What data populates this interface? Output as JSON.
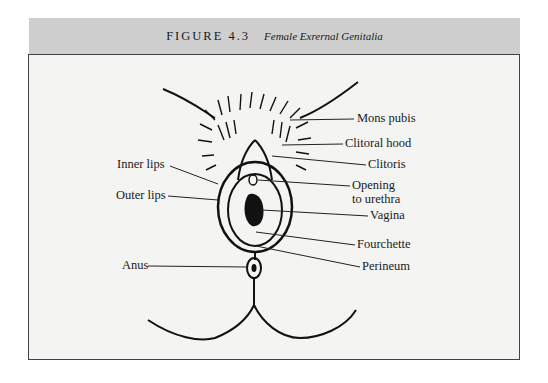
{
  "figure": {
    "number": "FIGURE 4.3",
    "title": "Female Exrernal Genitalia"
  },
  "labels": {
    "right": [
      {
        "text": "Mons pubis"
      },
      {
        "text": "Clitoral hood"
      },
      {
        "text": "Clitoris"
      },
      {
        "line1": "Opening",
        "line2": "to urethra"
      },
      {
        "text": "Vagina"
      },
      {
        "text": "Fourchette"
      },
      {
        "text": "Perineum"
      }
    ],
    "left": [
      {
        "text": "Inner lips"
      },
      {
        "text": "Outer lips"
      },
      {
        "text": "Anus"
      }
    ]
  }
}
